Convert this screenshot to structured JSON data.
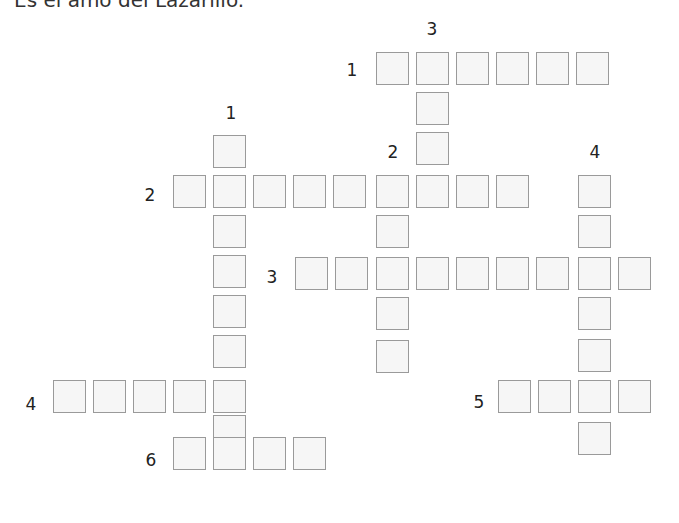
{
  "title": "Es el amo del Lazarillo.",
  "colors": {
    "cell_bg": "#f6f6f6",
    "cell_border": "#9a9a9a",
    "text": "#222222"
  },
  "cell_size": 33,
  "labels": [
    {
      "id": "down-3",
      "text": "3",
      "x": 432,
      "y": 29
    },
    {
      "id": "across-1",
      "text": "1",
      "x": 352,
      "y": 70
    },
    {
      "id": "down-1",
      "text": "1",
      "x": 231,
      "y": 113
    },
    {
      "id": "down-2",
      "text": "2",
      "x": 393,
      "y": 152
    },
    {
      "id": "down-4",
      "text": "4",
      "x": 595,
      "y": 152
    },
    {
      "id": "across-2",
      "text": "2",
      "x": 150,
      "y": 195
    },
    {
      "id": "across-3",
      "text": "3",
      "x": 272,
      "y": 277
    },
    {
      "id": "across-4",
      "text": "4",
      "x": 31,
      "y": 404
    },
    {
      "id": "across-5",
      "text": "5",
      "x": 479,
      "y": 402
    },
    {
      "id": "across-6",
      "text": "6",
      "x": 151,
      "y": 460
    }
  ],
  "words": [
    {
      "id": "across-1",
      "cells": [
        [
          376,
          52
        ],
        [
          416,
          52
        ],
        [
          456,
          52
        ],
        [
          496,
          52
        ],
        [
          536,
          52
        ],
        [
          576,
          52
        ]
      ]
    },
    {
      "id": "down-3",
      "cells": [
        [
          416,
          92
        ],
        [
          416,
          132
        ]
      ]
    },
    {
      "id": "down-1",
      "cells": [
        [
          213,
          135
        ],
        [
          213,
          215
        ],
        [
          213,
          255
        ],
        [
          213,
          295
        ],
        [
          213,
          335
        ],
        [
          213,
          415
        ]
      ]
    },
    {
      "id": "across-2",
      "cells": [
        [
          173,
          175
        ],
        [
          213,
          175
        ],
        [
          253,
          175
        ],
        [
          293,
          175
        ],
        [
          333,
          175
        ],
        [
          376,
          175
        ],
        [
          416,
          175
        ],
        [
          456,
          175
        ],
        [
          496,
          175
        ]
      ]
    },
    {
      "id": "down-2",
      "cells": [
        [
          376,
          215
        ],
        [
          376,
          297
        ],
        [
          376,
          340
        ]
      ]
    },
    {
      "id": "down-4",
      "cells": [
        [
          578,
          175
        ],
        [
          578,
          215
        ],
        [
          578,
          297
        ],
        [
          578,
          339
        ],
        [
          578,
          422
        ]
      ]
    },
    {
      "id": "across-3",
      "cells": [
        [
          295,
          257
        ],
        [
          335,
          257
        ],
        [
          376,
          257
        ],
        [
          416,
          257
        ],
        [
          456,
          257
        ],
        [
          496,
          257
        ],
        [
          536,
          257
        ],
        [
          578,
          257
        ],
        [
          618,
          257
        ]
      ]
    },
    {
      "id": "across-5",
      "cells": [
        [
          498,
          380
        ],
        [
          538,
          380
        ],
        [
          578,
          380
        ],
        [
          618,
          380
        ]
      ]
    },
    {
      "id": "across-4",
      "cells": [
        [
          53,
          380
        ],
        [
          93,
          380
        ],
        [
          133,
          380
        ],
        [
          173,
          380
        ],
        [
          213,
          380
        ]
      ]
    },
    {
      "id": "across-6",
      "cells": [
        [
          173,
          437
        ],
        [
          213,
          437
        ],
        [
          253,
          437
        ],
        [
          293,
          437
        ]
      ]
    }
  ]
}
